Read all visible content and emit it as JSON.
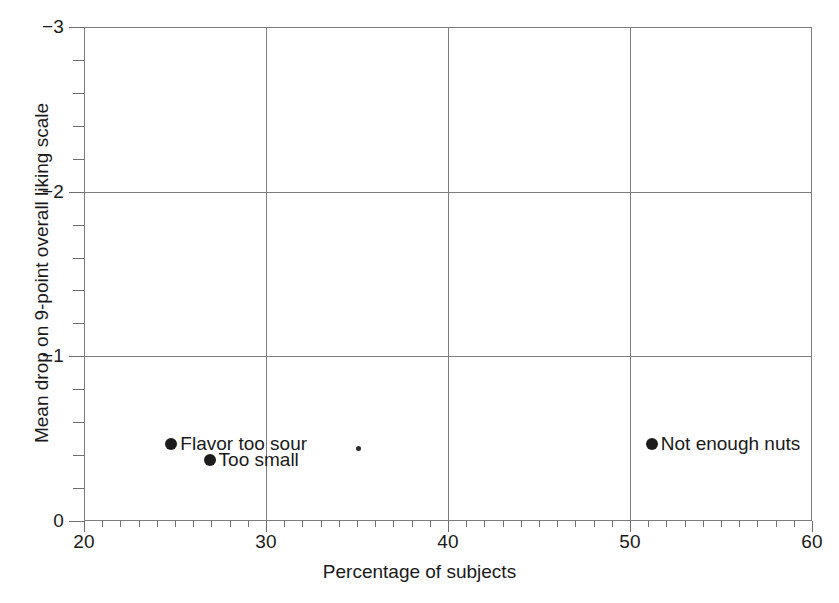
{
  "chart_data": {
    "type": "scatter",
    "title": "",
    "xlabel": "Percentage of subjects",
    "ylabel": "Mean drop on 9-point overall liking scale",
    "xlim": [
      20,
      60
    ],
    "ylim": [
      -3,
      0
    ],
    "y_axis_inverted": true,
    "grid": true,
    "legend": "none",
    "x_major_ticks": [
      20,
      30,
      40,
      50,
      60
    ],
    "x_tick_labels": [
      "20",
      "30",
      "40",
      "50",
      "60"
    ],
    "x_minor_tick_step": 1,
    "y_major_ticks": [
      -3,
      -2,
      -1,
      0
    ],
    "y_tick_labels": [
      "−3",
      "−2",
      "−1",
      "0"
    ],
    "y_minor_tick_step": 0.2,
    "gridlines_x": [
      30,
      40,
      50
    ],
    "gridlines_y": [
      -2,
      -1
    ],
    "marker_color": "#1c1c1c",
    "axis_color": "#7d7d7d",
    "background_color": "#ffffff",
    "points": [
      {
        "label": "Flavor too sour",
        "x": 24.8,
        "y": -0.47,
        "label_side": "right",
        "marker": "circle"
      },
      {
        "label": "Too small",
        "x": 26.9,
        "y": -0.37,
        "label_side": "right",
        "marker": "circle"
      },
      {
        "label": "Not enough nuts",
        "x": 51.2,
        "y": -0.47,
        "label_side": "right",
        "marker": "circle"
      },
      {
        "label": "",
        "x": 35.1,
        "y": -0.44,
        "label_side": "right",
        "marker": "dot-small"
      }
    ]
  }
}
